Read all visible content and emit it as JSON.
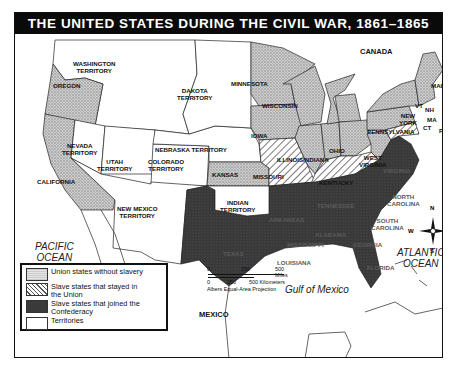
{
  "title": "THE UNITED STATES DURING THE CIVIL WAR, 1861–1865",
  "colors": {
    "union_free": "#bdbdbd",
    "border_slave": "#d8d8d8",
    "confederacy": "#3a3a3a",
    "territory": "#ffffff",
    "title_bar": "#0a0a0a"
  },
  "regions": {
    "territories": [
      "WASHINGTON TERRITORY",
      "DAKOTA TERRITORY",
      "NEBRASKA TERRITORY",
      "NEVADA TERRITORY",
      "UTAH TERRITORY",
      "COLORADO TERRITORY",
      "NEW MEXICO TERRITORY",
      "INDIAN TERRITORY"
    ],
    "union_free_states": [
      "OREGON",
      "CALIFORNIA",
      "MINNESOTA",
      "WISCONSIN",
      "IOWA",
      "KANSAS",
      "ILLINOIS",
      "INDIANA",
      "OHIO",
      "PENNSYLVANIA",
      "NEW YORK",
      "MAINE",
      "VT",
      "NH",
      "MA",
      "CT",
      "RI",
      "NJ",
      "WEST VIRGINIA"
    ],
    "border_slave_states": [
      "MISSOURI",
      "KENTUCKY",
      "MD",
      "DE"
    ],
    "confederate_states": [
      "TEXAS",
      "ARKANSAS",
      "LOUISIANA",
      "MISSISSIPPI",
      "TENNESSEE",
      "ALABAMA",
      "GEORGIA",
      "FLORIDA",
      "SOUTH CAROLINA",
      "NORTH CAROLINA",
      "VIRGINIA"
    ]
  },
  "labels": {
    "washington": "WASHINGTON",
    "washington2": "TERRITORY",
    "oregon": "OREGON",
    "california": "CALIFORNIA",
    "nevada": "NEVADA",
    "nevada2": "TERRITORY",
    "utah": "UTAH",
    "utah2": "TERRITORY",
    "colorado": "COLORADO",
    "colorado2": "TERRITORY",
    "newmexico": "NEW MEXICO",
    "newmexico2": "TERRITORY",
    "dakota": "DAKOTA",
    "dakota2": "TERRITORY",
    "nebraska": "NEBRASKA TERRITORY",
    "indian": "INDIAN",
    "indian2": "TERRITORY",
    "minnesota": "MINNESOTA",
    "wisconsin": "WISCONSIN",
    "iowa": "IOWA",
    "kansas": "KANSAS",
    "missouri": "MISSOURI",
    "illinois": "ILLINOIS",
    "indiana": "INDIANA",
    "ohio": "OHIO",
    "kentucky": "KENTUCKY",
    "westvirginia": "WEST",
    "westvirginia2": "VIRGINIA",
    "pennsylvania": "PENNSYLVANIA",
    "newyork": "NEW",
    "newyork2": "YORK",
    "maine": "MAINE",
    "vt": "VT",
    "nh": "NH",
    "ma": "MA",
    "ct": "CT",
    "ri": "RI",
    "texas": "TEXAS",
    "arkansas": "ARKANSAS",
    "louisiana": "LOUISIANA",
    "mississippi": "MISSISSIPPI",
    "tennessee": "TENNESSEE",
    "alabama": "ALABAMA",
    "georgia": "GEORGIA",
    "florida": "FLORIDA",
    "southcarolina": "SOUTH",
    "southcarolina2": "CAROLINA",
    "northcarolina": "NORTH",
    "northcarolina2": "CAROLINA",
    "virginia": "VIRGINIA"
  },
  "water": {
    "pacific": "PACIFIC",
    "pacific2": "OCEAN",
    "atlantic": "ATLANTIC",
    "atlantic2": "OCEAN",
    "gulf": "Gulf of Mexico"
  },
  "countries": {
    "canada": "CANADA",
    "mexico": "MEXICO"
  },
  "legend": {
    "items": [
      {
        "label": "Union states without slavery"
      },
      {
        "label": "Slave states that stayed in the Union"
      },
      {
        "label": "Slave states that joined the Confederacy"
      },
      {
        "label": "Territories"
      }
    ]
  },
  "scale": {
    "miles_ticks": [
      "0",
      "250",
      "500 Miles"
    ],
    "km_ticks": [
      "0",
      "250",
      "500 Kilometers"
    ],
    "projection": "Albers Equal-Area Projection"
  },
  "compass": {
    "n": "N",
    "s": "S",
    "e": "E",
    "w": "W"
  }
}
